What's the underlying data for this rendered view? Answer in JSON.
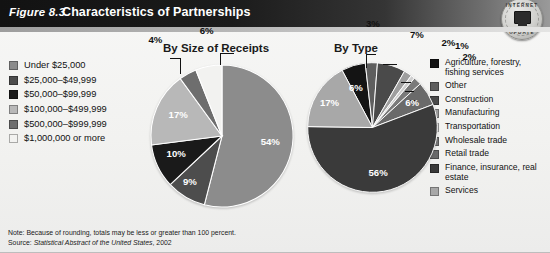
{
  "header": {
    "figure_number": "Figure 8.3",
    "title": "Characteristics of Partnerships",
    "badge": {
      "name": "internet-update-badge",
      "text_top": "INTERNET",
      "text_bottom": "UPDATE",
      "icon": "computer-monitor-icon"
    }
  },
  "colors": {
    "slice_1": "#8c8c8c",
    "slice_2": "#4d4d4d",
    "slice_3": "#1a1a1a",
    "slice_4": "#b8b8b8",
    "slice_5": "#6e6e6e",
    "slice_6": "#f2f2f0",
    "type_agriculture": "#141414",
    "type_other": "#5e5e5e",
    "type_construction": "#4a4a4a",
    "type_manufacturing": "#9e9e9e",
    "type_transportation": "#cfcfcf",
    "type_wholesale": "#7a7a7a",
    "type_retail": "#6a6a6a",
    "type_finance": "#3a3a3a",
    "type_services": "#a8a8a8",
    "header_dark": "#121212",
    "background": "#f3f3f1"
  },
  "legend_left": {
    "items": [
      {
        "label": "Under $25,000",
        "color": "#8c8c8c"
      },
      {
        "label": "$25,000–$49,999",
        "color": "#4d4d4d"
      },
      {
        "label": "$50,000–$99,999",
        "color": "#1a1a1a"
      },
      {
        "label": "$100,000–$499,999",
        "color": "#b8b8b8"
      },
      {
        "label": "$500,000–$999,999",
        "color": "#6e6e6e"
      },
      {
        "label": "$1,000,000 or more",
        "color": "#f2f2f0"
      }
    ]
  },
  "legend_right": {
    "items": [
      {
        "label": "Agriculture, forestry, fishing services",
        "color": "#141414"
      },
      {
        "label": "Other",
        "color": "#5e5e5e"
      },
      {
        "label": "Construction",
        "color": "#4a4a4a"
      },
      {
        "label": "Manufacturing",
        "color": "#9e9e9e"
      },
      {
        "label": "Transportation",
        "color": "#cfcfcf"
      },
      {
        "label": "Wholesale trade",
        "color": "#7a7a7a"
      },
      {
        "label": "Retail trade",
        "color": "#6a6a6a"
      },
      {
        "label": "Finance, insurance, real estate",
        "color": "#3a3a3a"
      },
      {
        "label": "Services",
        "color": "#a8a8a8"
      }
    ]
  },
  "footer": {
    "note": "Note: Because of rounding, totals may be less or greater than 100 percent.",
    "source_prefix": "Source: ",
    "source_italic": "Statistical Abstract of the United States",
    "source_suffix": ", 2002"
  },
  "chart_data": [
    {
      "type": "pie",
      "title": "By Size of Receipts",
      "categories": [
        "Under $25,000",
        "$25,000–$49,999",
        "$50,000–$99,999",
        "$100,000–$499,999",
        "$500,000–$999,999",
        "$1,000,000 or more"
      ],
      "values": [
        54,
        9,
        10,
        17,
        4,
        6
      ],
      "labels": [
        "54%",
        "9%",
        "10%",
        "17%",
        "4%",
        "6%"
      ],
      "colors": [
        "#8c8c8c",
        "#4d4d4d",
        "#1a1a1a",
        "#b8b8b8",
        "#6e6e6e",
        "#f2f2f0"
      ],
      "unit": "percent",
      "legend_position": "left"
    },
    {
      "type": "pie",
      "title": "By Type",
      "categories": [
        "Agriculture, forestry, fishing services",
        "Other",
        "Construction",
        "Manufacturing",
        "Transportation",
        "Wholesale trade",
        "Retail trade",
        "Finance, insurance, real estate",
        "Services"
      ],
      "values": [
        6,
        3,
        7,
        2,
        1,
        2,
        6,
        56,
        17
      ],
      "labels": [
        "6%",
        "3%",
        "7%",
        "2%",
        "1%",
        "2%",
        "6%",
        "56%",
        "17%"
      ],
      "colors": [
        "#141414",
        "#5e5e5e",
        "#4a4a4a",
        "#9e9e9e",
        "#cfcfcf",
        "#7a7a7a",
        "#6a6a6a",
        "#3a3a3a",
        "#a8a8a8"
      ],
      "unit": "percent",
      "legend_position": "right"
    }
  ]
}
